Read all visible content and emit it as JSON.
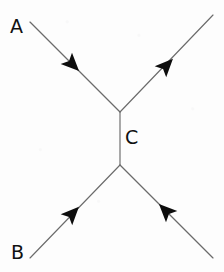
{
  "diagram": {
    "background_color": "#fdfdfd",
    "line_color": "#6b6b6b",
    "arrow_color": "#0d0d0d",
    "label_color": "#111111",
    "canvas": {
      "width": 224,
      "height": 272
    },
    "labels": [
      {
        "id": "A",
        "text": "A",
        "x": 10,
        "y": 17,
        "role": "incoming-particle-label"
      },
      {
        "id": "B",
        "text": "B",
        "x": 11,
        "y": 243,
        "role": "incoming-particle-label"
      },
      {
        "id": "C",
        "text": "C",
        "x": 125,
        "y": 128,
        "role": "propagator-label"
      }
    ],
    "vertices": [
      {
        "id": "upper-vertex",
        "x": 120,
        "y": 112
      },
      {
        "id": "lower-vertex",
        "x": 120,
        "y": 165
      }
    ],
    "edges": [
      {
        "id": "incoming-a",
        "name": "incoming-line-a",
        "from": {
          "x": 30,
          "y": 22
        },
        "to": {
          "x": 120,
          "y": 112
        },
        "arrow": {
          "x": 72,
          "y": 64,
          "angle_deg": 45,
          "direction": "toward-vertex"
        }
      },
      {
        "id": "outgoing-top-right",
        "name": "outgoing-line-top-right",
        "from": {
          "x": 120,
          "y": 112
        },
        "to": {
          "x": 213,
          "y": 15
        },
        "arrow": {
          "x": 166,
          "y": 66,
          "angle_deg": -46,
          "direction": "away-from-vertex"
        }
      },
      {
        "id": "propagator-c",
        "name": "propagator-line-c",
        "from": {
          "x": 120,
          "y": 112
        },
        "to": {
          "x": 120,
          "y": 165
        },
        "arrow": null
      },
      {
        "id": "incoming-b",
        "name": "incoming-line-b",
        "from": {
          "x": 30,
          "y": 258
        },
        "to": {
          "x": 120,
          "y": 165
        },
        "arrow": {
          "x": 72,
          "y": 214,
          "angle_deg": -46,
          "direction": "toward-vertex"
        }
      },
      {
        "id": "outgoing-bottom-right",
        "name": "outgoing-line-bottom-right",
        "from": {
          "x": 120,
          "y": 165
        },
        "to": {
          "x": 213,
          "y": 258
        },
        "arrow": {
          "x": 166,
          "y": 211,
          "angle_deg": 225,
          "direction": "toward-vertex"
        }
      }
    ]
  }
}
